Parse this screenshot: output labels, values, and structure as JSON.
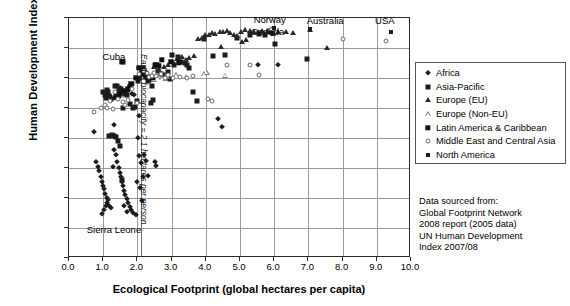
{
  "chart_data": {
    "type": "scatter",
    "title": "",
    "xlabel": "Ecological Footprint (global hectares per capita)",
    "ylabel": "Human Development Index",
    "xlim": [
      0.0,
      10.0
    ],
    "ylim": [
      0.2,
      1.0
    ],
    "xticks": [
      "0.0",
      "1.0",
      "2.0",
      "3.0",
      "4.0",
      "5.0",
      "6.0",
      "7.0",
      "8.0",
      "9.0",
      "10.0"
    ],
    "yticks": [
      "0.200",
      "0.300",
      "0.400",
      "0.500",
      "0.600",
      "0.700",
      "0.800",
      "0.900",
      "1.000"
    ],
    "grid": "horizontal-and-vertical",
    "legend_position": "right",
    "annotations": [
      {
        "text": "Cuba",
        "x": 1.6,
        "y": 0.855
      },
      {
        "text": "Sierra Leone",
        "x": 0.95,
        "y": 0.295
      },
      {
        "text": "Norway",
        "x": 6.0,
        "y": 1.0
      },
      {
        "text": "Canada",
        "x": 5.9,
        "y": 0.963
      },
      {
        "text": "Australia",
        "x": 7.6,
        "y": 0.995
      },
      {
        "text": "USA",
        "x": 9.2,
        "y": 0.995
      },
      {
        "text": "Earth's biocapacity = 2.1 hectares per person",
        "x": 2.1,
        "y": 0.7
      }
    ],
    "reference_line": {
      "label": "Earth's biocapacity = 2.1 hectares per person",
      "x": 2.1
    },
    "series": [
      {
        "name": "Africa",
        "marker": "diamond-filled",
        "color": "#1c1c1c",
        "points": [
          [
            0.73,
            0.62
          ],
          [
            0.8,
            0.52
          ],
          [
            0.85,
            0.505
          ],
          [
            0.88,
            0.49
          ],
          [
            0.92,
            0.47
          ],
          [
            0.95,
            0.455
          ],
          [
            0.98,
            0.44
          ],
          [
            1.02,
            0.43
          ],
          [
            1.05,
            0.415
          ],
          [
            1.1,
            0.4
          ],
          [
            1.12,
            0.385
          ],
          [
            1.18,
            0.375
          ],
          [
            1.22,
            0.368
          ],
          [
            1.3,
            0.645
          ],
          [
            1.32,
            0.56
          ],
          [
            1.38,
            0.545
          ],
          [
            1.4,
            0.52
          ],
          [
            1.45,
            0.5
          ],
          [
            1.48,
            0.485
          ],
          [
            1.52,
            0.47
          ],
          [
            1.55,
            0.455
          ],
          [
            1.58,
            0.44
          ],
          [
            1.62,
            0.425
          ],
          [
            1.65,
            0.41
          ],
          [
            1.7,
            0.398
          ],
          [
            1.72,
            0.385
          ],
          [
            1.78,
            0.37
          ],
          [
            1.82,
            0.36
          ],
          [
            1.88,
            0.35
          ],
          [
            1.95,
            0.345
          ],
          [
            1.35,
            0.735
          ],
          [
            1.38,
            0.745
          ],
          [
            1.42,
            0.752
          ],
          [
            1.45,
            0.758
          ],
          [
            1.2,
            0.74
          ],
          [
            1.25,
            0.73
          ],
          [
            1.5,
            0.76
          ],
          [
            1.85,
            0.748
          ],
          [
            1.9,
            0.742
          ],
          [
            2.02,
            0.6
          ],
          [
            2.05,
            0.54
          ],
          [
            2.1,
            0.518
          ],
          [
            2.12,
            0.39
          ],
          [
            2.2,
            0.545
          ],
          [
            2.25,
            0.525
          ],
          [
            2.5,
            0.52
          ],
          [
            2.55,
            0.508
          ],
          [
            4.35,
            0.665
          ],
          [
            4.48,
            0.638
          ],
          [
            5.52,
            0.845
          ],
          [
            6.1,
            0.842
          ],
          [
            2.05,
            0.675
          ],
          [
            1.98,
            0.455
          ],
          [
            2.08,
            0.435
          ],
          [
            1.28,
            0.505
          ],
          [
            1.15,
            0.395
          ],
          [
            1.08,
            0.375
          ],
          [
            1.02,
            0.36
          ],
          [
            0.95,
            0.348
          ],
          [
            2.15,
            0.47
          ],
          [
            1.6,
            0.375
          ],
          [
            1.68,
            0.355
          ],
          [
            2.3,
            0.475
          ]
        ]
      },
      {
        "name": "Asia-Pacific",
        "marker": "square-filled",
        "color": "#1c1c1c",
        "points": [
          [
            1.0,
            0.755
          ],
          [
            1.05,
            0.745
          ],
          [
            1.08,
            0.735
          ],
          [
            1.12,
            0.76
          ],
          [
            1.15,
            0.752
          ],
          [
            1.18,
            0.74
          ],
          [
            1.22,
            0.73
          ],
          [
            1.35,
            0.775
          ],
          [
            1.4,
            0.772
          ],
          [
            1.45,
            0.768
          ],
          [
            1.52,
            0.762
          ],
          [
            1.58,
            0.7
          ],
          [
            1.62,
            0.755
          ],
          [
            1.65,
            0.748
          ],
          [
            1.7,
            0.745
          ],
          [
            1.78,
            0.712
          ],
          [
            1.88,
            0.7
          ],
          [
            1.92,
            0.705
          ],
          [
            1.98,
            0.725
          ],
          [
            2.02,
            0.79
          ],
          [
            2.05,
            0.8
          ],
          [
            2.08,
            0.81
          ],
          [
            2.12,
            0.815
          ],
          [
            2.15,
            0.835
          ],
          [
            2.18,
            0.822
          ],
          [
            2.22,
            0.812
          ],
          [
            2.25,
            0.805
          ],
          [
            2.3,
            0.8
          ],
          [
            2.35,
            0.795
          ],
          [
            2.4,
            0.718
          ],
          [
            2.45,
            0.728
          ],
          [
            2.52,
            0.845
          ],
          [
            2.6,
            0.825
          ],
          [
            2.68,
            0.812
          ],
          [
            2.75,
            0.81
          ],
          [
            2.82,
            0.8
          ],
          [
            3.02,
            0.878
          ],
          [
            3.18,
            0.87
          ],
          [
            3.28,
            0.855
          ],
          [
            3.38,
            0.85
          ],
          [
            3.45,
            0.843
          ],
          [
            3.52,
            0.835
          ],
          [
            3.62,
            0.755
          ],
          [
            3.75,
            0.722
          ],
          [
            3.95,
            0.93
          ],
          [
            4.22,
            0.875
          ],
          [
            4.55,
            0.878
          ],
          [
            4.92,
            0.935
          ],
          [
            5.28,
            0.942
          ],
          [
            5.55,
            0.948
          ],
          [
            5.72,
            0.943
          ],
          [
            6.02,
            0.915
          ],
          [
            6.95,
            0.865
          ],
          [
            1.58,
            0.855
          ],
          [
            2.88,
            0.82
          ],
          [
            2.95,
            0.798
          ],
          [
            5.85,
            0.958
          ],
          [
            5.92,
            0.952
          ],
          [
            2.42,
            0.775
          ],
          [
            1.55,
            0.46
          ],
          [
            1.48,
            0.575
          ],
          [
            1.42,
            0.59
          ],
          [
            1.38,
            0.605
          ],
          [
            1.3,
            0.608
          ],
          [
            1.25,
            0.61
          ],
          [
            1.18,
            0.608
          ],
          [
            2.32,
            0.79
          ],
          [
            3.08,
            0.845
          ]
        ]
      },
      {
        "name": "Europe (EU)",
        "marker": "triangle-filled",
        "color": "#2a2a2a",
        "points": [
          [
            3.15,
            0.865
          ],
          [
            3.3,
            0.87
          ],
          [
            3.42,
            0.86
          ],
          [
            3.52,
            0.868
          ],
          [
            3.65,
            0.872
          ],
          [
            3.78,
            0.93
          ],
          [
            3.88,
            0.935
          ],
          [
            3.98,
            0.942
          ],
          [
            4.08,
            0.945
          ],
          [
            4.18,
            0.95
          ],
          [
            4.28,
            0.948
          ],
          [
            4.4,
            0.955
          ],
          [
            4.5,
            0.952
          ],
          [
            4.62,
            0.958
          ],
          [
            4.72,
            0.95
          ],
          [
            4.82,
            0.945
          ],
          [
            4.92,
            0.94
          ],
          [
            5.02,
            0.955
          ],
          [
            5.15,
            0.96
          ],
          [
            5.28,
            0.958
          ],
          [
            5.4,
            0.952
          ],
          [
            5.52,
            0.955
          ],
          [
            5.65,
            0.958
          ],
          [
            5.8,
            0.952
          ],
          [
            5.95,
            0.948
          ],
          [
            6.12,
            0.955
          ],
          [
            6.35,
            0.953
          ],
          [
            6.55,
            0.95
          ],
          [
            7.05,
            0.96
          ],
          [
            7.55,
            0.9
          ],
          [
            2.62,
            0.828
          ],
          [
            2.78,
            0.838
          ],
          [
            2.9,
            0.845
          ],
          [
            3.05,
            0.855
          ],
          [
            1.48,
            0.742
          ],
          [
            2.48,
            0.838
          ],
          [
            4.45,
            0.905
          ],
          [
            5.05,
            0.92
          ],
          [
            5.18,
            0.928
          ]
        ]
      },
      {
        "name": "Europe (Non-EU)",
        "marker": "triangle-open",
        "color": "#7e7e7e",
        "points": [
          [
            2.72,
            0.8
          ],
          [
            2.85,
            0.805
          ],
          [
            3.12,
            0.81
          ],
          [
            3.42,
            0.805
          ],
          [
            3.95,
            0.812
          ],
          [
            4.02,
            0.818
          ],
          [
            4.55,
            0.808
          ],
          [
            2.58,
            0.802
          ],
          [
            1.52,
            0.74
          ],
          [
            2.48,
            0.795
          ],
          [
            2.4,
            0.802
          ],
          [
            5.9,
            0.963
          ]
        ]
      },
      {
        "name": "Latin America & Caribbean",
        "marker": "square-dark",
        "color": "#111111",
        "points": [
          [
            1.55,
            0.855
          ],
          [
            1.95,
            0.8
          ],
          [
            2.05,
            0.835
          ],
          [
            2.12,
            0.828
          ],
          [
            2.18,
            0.818
          ],
          [
            2.25,
            0.81
          ],
          [
            2.32,
            0.805
          ],
          [
            2.45,
            0.8
          ],
          [
            2.55,
            0.845
          ],
          [
            2.62,
            0.84
          ],
          [
            1.78,
            0.77
          ],
          [
            1.82,
            0.78
          ],
          [
            1.72,
            0.762
          ],
          [
            1.62,
            0.758
          ],
          [
            1.48,
            0.748
          ],
          [
            1.45,
            0.742
          ],
          [
            1.38,
            0.738
          ],
          [
            2.72,
            0.86
          ],
          [
            2.98,
            0.855
          ],
          [
            3.22,
            0.852
          ]
        ]
      },
      {
        "name": "Middle East and Central Asia",
        "marker": "circle-open",
        "color": "#6a6a6a",
        "points": [
          [
            0.72,
            0.688
          ],
          [
            0.92,
            0.7
          ],
          [
            1.05,
            0.71
          ],
          [
            1.2,
            0.725
          ],
          [
            1.35,
            0.755
          ],
          [
            1.58,
            0.72
          ],
          [
            1.72,
            0.728
          ],
          [
            1.85,
            0.765
          ],
          [
            1.98,
            0.718
          ],
          [
            2.05,
            0.815
          ],
          [
            2.18,
            0.822
          ],
          [
            2.28,
            0.818
          ],
          [
            2.35,
            0.805
          ],
          [
            2.42,
            0.808
          ],
          [
            2.55,
            0.808
          ],
          [
            2.68,
            0.812
          ],
          [
            2.82,
            0.8
          ],
          [
            3.25,
            0.805
          ],
          [
            3.45,
            0.8
          ],
          [
            3.62,
            0.808
          ],
          [
            4.05,
            0.73
          ],
          [
            4.18,
            0.722
          ],
          [
            4.62,
            0.843
          ],
          [
            5.28,
            0.842
          ],
          [
            5.55,
            0.81
          ],
          [
            8.02,
            0.93
          ],
          [
            9.28,
            0.925
          ],
          [
            1.12,
            0.7
          ],
          [
            1.28,
            0.698
          ],
          [
            2.48,
            0.818
          ],
          [
            2.9,
            0.81
          ],
          [
            3.05,
            0.8
          ],
          [
            1.42,
            0.73
          ],
          [
            1.65,
            0.71
          ]
        ]
      },
      {
        "name": "North America",
        "marker": "square-small",
        "color": "#1c1c1c",
        "points": [
          [
            5.98,
            0.968
          ],
          [
            7.05,
            0.962
          ],
          [
            9.42,
            0.952
          ]
        ]
      }
    ]
  },
  "axes": {
    "y_title": "Human Development Index",
    "x_title": "Ecological Footprint (global hectares per capita)"
  },
  "legend": {
    "items": [
      {
        "label": "Africa",
        "marker": "diamond-filled"
      },
      {
        "label": "Asia-Pacific",
        "marker": "square-filled"
      },
      {
        "label": "Europe (EU)",
        "marker": "triangle-filled"
      },
      {
        "label": "Europe (Non-EU)",
        "marker": "triangle-open"
      },
      {
        "label": "Latin America & Caribbean",
        "marker": "square-dark"
      },
      {
        "label": "Middle East and Central Asia",
        "marker": "circle-open"
      },
      {
        "label": "North America",
        "marker": "square-small"
      }
    ]
  },
  "source_note": {
    "lines": [
      "Data sourced from:",
      "Global Footprint Network",
      "2008 report (2005 data)",
      "UN Human Development",
      "Index 2007/08"
    ]
  },
  "callouts": {
    "cuba": "Cuba",
    "sierra_leone": "Sierra Leone",
    "norway": "Norway",
    "canada": "Canada",
    "australia": "Australia",
    "usa": "USA",
    "biocapacity": "Earth's biocapacity = 2.1 hectares per person"
  }
}
